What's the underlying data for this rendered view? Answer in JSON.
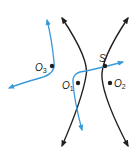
{
  "diagram": {
    "type": "hyperbola-locating-diagram",
    "colors": {
      "hyperbola": "#231f20",
      "path": "#3a9ad9",
      "points": "#231f20"
    },
    "points": [
      {
        "id": "O3",
        "label": "O",
        "sub": "3"
      },
      {
        "id": "O1",
        "label": "O",
        "sub": "1"
      },
      {
        "id": "O2",
        "label": "O",
        "sub": "2"
      },
      {
        "id": "S",
        "label": "S",
        "sub": ""
      }
    ],
    "curves": [
      {
        "name": "left-hyperbola-branch",
        "arrows": "both-ends"
      },
      {
        "name": "right-hyperbola-branch",
        "arrows": "both-ends"
      },
      {
        "name": "blue-path-1",
        "arrows": "both-ends"
      },
      {
        "name": "blue-path-2",
        "arrows": "both-ends"
      }
    ]
  }
}
